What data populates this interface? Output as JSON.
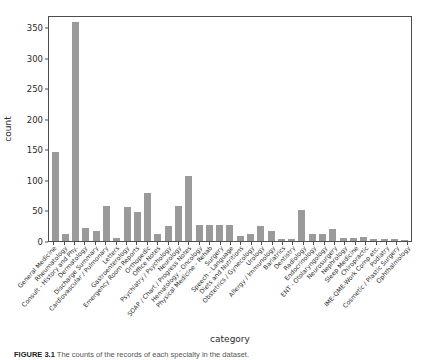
{
  "chart_data": {
    "type": "bar",
    "title": "",
    "xlabel": "category",
    "ylabel": "count",
    "ylim": [
      0,
      370
    ],
    "yticks": [
      0,
      50,
      100,
      150,
      200,
      250,
      300,
      350
    ],
    "grid": false,
    "legend": null,
    "bar_color": "#9a9a9a",
    "categories": [
      "General Medicine",
      "Rheumatology",
      "Consult - History and Phy.",
      "Dermatology",
      "Discharge Summary",
      "Cardiovascular / Pulmonary",
      "Letters",
      "Gastroenterology",
      "Emergency Room Reports",
      "Orthopedic",
      "Office Notes",
      "Psychiatry / Psychology",
      "Neurology",
      "SOAP / Chart / Progress Notes",
      "Hematology - Oncology",
      "Physical Medicine - Rehab",
      "Surgery",
      "Speech - Language",
      "Diets and Nutritions",
      "Obstetrics / Gynecology",
      "Urology",
      "Allergy / Immunology",
      "Bariatrics",
      "Dentistry",
      "Radiology",
      "Endocrinology",
      "ENT - Otolaryngology",
      "Neurosurgery",
      "Nephrology",
      "Sleep Medicine",
      "Chiropractic",
      "IME-QME-Work Comp etc.",
      "Podiatry",
      "Cosmetic / Plastic Surgery",
      "Ophthalmology"
    ],
    "values": [
      146,
      11,
      358,
      22,
      16,
      57,
      5,
      56,
      48,
      78,
      12,
      24,
      57,
      106,
      26,
      26,
      26,
      26,
      9,
      12,
      25,
      16,
      3,
      3,
      50,
      11,
      11,
      20,
      5,
      5,
      7,
      3,
      3,
      3,
      2
    ]
  },
  "caption": {
    "label": "FIGURE 3.1",
    "text": "The counts of the records of each specialty in the dataset."
  }
}
